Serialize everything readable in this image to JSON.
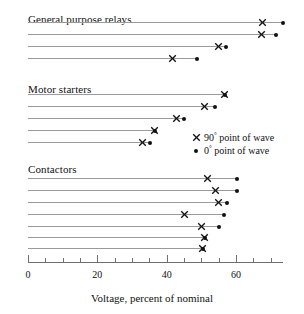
{
  "chart_data": {
    "type": "scatter",
    "title": "",
    "xlabel": "Voltage, percent of nominal",
    "ylabel": "",
    "xlim": [
      0,
      73.5
    ],
    "xticks_major": [
      0,
      20,
      40,
      60
    ],
    "xtick_labels": [
      "0",
      "20",
      "40",
      "60"
    ],
    "xticks_minor_step": 5,
    "grid": false,
    "legend_position": "middle-right",
    "series": [
      {
        "name": "90° point of wave",
        "marker": "cross"
      },
      {
        "name": "0° point of wave",
        "marker": "dot"
      }
    ],
    "groups": [
      {
        "label": "General purpose relays",
        "rows": [
          {
            "cross": 67.7,
            "dot": 73.5
          },
          {
            "cross": 67.4,
            "dot": 71.5
          },
          {
            "cross": 54.8,
            "dot": 57.1
          },
          {
            "cross": 41.8,
            "dot": 48.7
          }
        ]
      },
      {
        "label": "Motor starters",
        "rows": [
          {
            "cross": 56.7,
            "dot": 56.7
          },
          {
            "cross": 51.0,
            "dot": 53.9
          },
          {
            "cross": 42.7,
            "dot": 45.0
          },
          {
            "cross": 36.6,
            "dot": 36.6
          },
          {
            "cross": 32.9,
            "dot": 35.2
          }
        ]
      },
      {
        "label": "Contactors",
        "rows": [
          {
            "cross": 51.9,
            "dot": 60.2
          },
          {
            "cross": 54.2,
            "dot": 60.2
          },
          {
            "cross": 55.0,
            "dot": 57.3
          },
          {
            "cross": 45.2,
            "dot": 56.5
          },
          {
            "cross": 50.1,
            "dot": 55.0
          },
          {
            "cross": 51.0,
            "dot": 51.0
          },
          {
            "cross": 50.4,
            "dot": 50.4
          }
        ]
      }
    ]
  },
  "axis": {
    "title": "Voltage, percent of nominal"
  },
  "legend": {
    "items": [
      {
        "symbol": "cross",
        "text": "90° point of wave"
      },
      {
        "symbol": "dot",
        "text": "0° point of wave"
      }
    ]
  },
  "layout": {
    "x0_px": 28,
    "px_per_unit": 3.468,
    "axis_y_px": 262,
    "group_title_y": [
      14,
      84,
      164
    ],
    "group_rows_y": [
      [
        22,
        34,
        46,
        58
      ],
      [
        94,
        106,
        118,
        130,
        142
      ],
      [
        178,
        190,
        202,
        214,
        226,
        237,
        248
      ]
    ],
    "legend_x_px": 190,
    "legend_y_px": 131
  },
  "colors": {
    "marker": "#111111",
    "row_line": "#9a9a9a",
    "axis": "#6f6f6f",
    "background": "#ffffff"
  }
}
